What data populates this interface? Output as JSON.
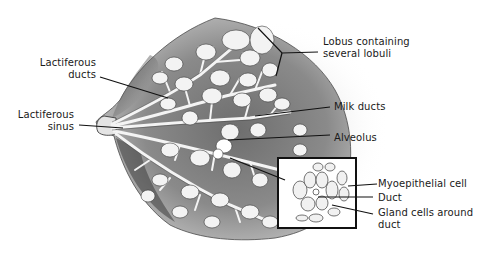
{
  "diagram": {
    "colors": {
      "background": "#ffffff",
      "ink": "#1a1a1a",
      "tissue_dark": "#3a3a3a",
      "tissue_mid": "#7a7a7a",
      "tissue_light": "#bdbdbd",
      "lobule_fill": "#f2f2f2"
    },
    "labels": {
      "lactiferous_ducts": {
        "line1": "Lactiferous",
        "line2": "ducts"
      },
      "lactiferous_sinus": {
        "line1": "Lactiferous",
        "line2": "sinus"
      },
      "lobus": {
        "line1": "Lobus containing",
        "line2": "several lobuli"
      },
      "milk_ducts": {
        "line1": "Milk ducts"
      },
      "alveolus": {
        "line1": "Alveolus"
      },
      "myoepithelial_cell": {
        "line1": "Myoepithelial cell"
      },
      "duct": {
        "line1": "Duct"
      },
      "gland_cells": {
        "line1": "Gland cells around",
        "line2": "duct"
      }
    },
    "inset": {
      "name": "magnified alveolus",
      "x": 278,
      "y": 158,
      "width": 78,
      "height": 70
    }
  }
}
